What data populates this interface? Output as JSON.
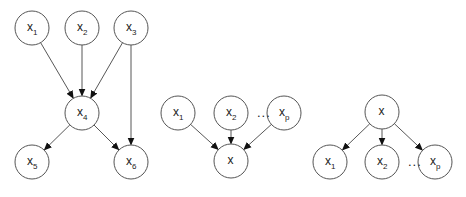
{
  "colors": {
    "background": "#ffffff",
    "node_stroke": "#555555",
    "edge": "#444444",
    "text": "#222222"
  },
  "diagrams": [
    {
      "name": "bayesian-network",
      "nodes": [
        {
          "id": "x1",
          "base": "x",
          "sub": "1",
          "cx": 32,
          "cy": 28
        },
        {
          "id": "x2",
          "base": "x",
          "sub": "2",
          "cx": 82,
          "cy": 28
        },
        {
          "id": "x3",
          "base": "x",
          "sub": "3",
          "cx": 131,
          "cy": 28
        },
        {
          "id": "x4",
          "base": "x",
          "sub": "4",
          "cx": 82,
          "cy": 113
        },
        {
          "id": "x5",
          "base": "x",
          "sub": "5",
          "cx": 32,
          "cy": 162
        },
        {
          "id": "x6",
          "base": "x",
          "sub": "6",
          "cx": 131,
          "cy": 162
        }
      ],
      "edges": [
        [
          "x1",
          "x4"
        ],
        [
          "x2",
          "x4"
        ],
        [
          "x3",
          "x4"
        ],
        [
          "x3",
          "x6"
        ],
        [
          "x4",
          "x5"
        ],
        [
          "x4",
          "x6"
        ]
      ]
    },
    {
      "name": "parents-to-child",
      "nodes": [
        {
          "id": "x1",
          "base": "x",
          "sub": "1",
          "cx": 178,
          "cy": 113
        },
        {
          "id": "x2",
          "base": "x",
          "sub": "2",
          "cx": 231,
          "cy": 113
        },
        {
          "id": "xp",
          "base": "x",
          "sub": "p",
          "cx": 284,
          "cy": 113
        },
        {
          "id": "x",
          "base": "x",
          "sub": "",
          "cx": 231,
          "cy": 161
        }
      ],
      "edges": [
        [
          "x1",
          "x"
        ],
        [
          "x2",
          "x"
        ],
        [
          "xp",
          "x"
        ]
      ],
      "ellipsis": {
        "text": "...",
        "x": 257,
        "y": 117
      }
    },
    {
      "name": "parent-to-children",
      "nodes": [
        {
          "id": "x",
          "base": "x",
          "sub": "",
          "cx": 382,
          "cy": 112
        },
        {
          "id": "x1",
          "base": "x",
          "sub": "1",
          "cx": 330,
          "cy": 162
        },
        {
          "id": "x2",
          "base": "x",
          "sub": "2",
          "cx": 382,
          "cy": 162
        },
        {
          "id": "xp",
          "base": "x",
          "sub": "p",
          "cx": 435,
          "cy": 162
        }
      ],
      "edges": [
        [
          "x",
          "x1"
        ],
        [
          "x",
          "x2"
        ],
        [
          "x",
          "xp"
        ]
      ],
      "ellipsis": {
        "text": "...",
        "x": 408,
        "y": 166
      }
    }
  ],
  "node_radius": 17
}
